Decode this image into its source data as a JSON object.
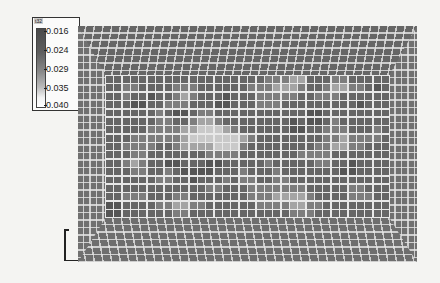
{
  "chart_data": {
    "type": "heatmap",
    "title": "",
    "legend": {
      "title": "t32",
      "ticks": [
        "0.016",
        "0.024",
        "0.029",
        "0.035",
        "0.040"
      ],
      "range": [
        0.016,
        0.04
      ],
      "colormap": "grayscale (dark = low, light = high)"
    },
    "grid": {
      "columns": 34,
      "rows": 17
    },
    "values_scale": "0=darkest (~0.016) ... 4=lightest (~0.040)",
    "values": [
      [
        1,
        1,
        1,
        1,
        1,
        1,
        1,
        1,
        1,
        1,
        1,
        1,
        1,
        1,
        1,
        1,
        1,
        1,
        1,
        2,
        2,
        2,
        3,
        3,
        1,
        1,
        1,
        2,
        2,
        1,
        1,
        1,
        1,
        1
      ],
      [
        1,
        1,
        2,
        2,
        1,
        1,
        1,
        1,
        2,
        2,
        2,
        1,
        1,
        1,
        1,
        1,
        1,
        2,
        2,
        2,
        3,
        3,
        3,
        2,
        1,
        1,
        2,
        3,
        3,
        2,
        2,
        1,
        0,
        1
      ],
      [
        1,
        1,
        2,
        1,
        1,
        0,
        1,
        1,
        2,
        3,
        2,
        1,
        1,
        1,
        0,
        1,
        1,
        1,
        2,
        2,
        2,
        2,
        2,
        1,
        1,
        2,
        2,
        2,
        1,
        1,
        1,
        1,
        1,
        1
      ],
      [
        1,
        1,
        1,
        0,
        0,
        1,
        1,
        2,
        2,
        2,
        1,
        1,
        1,
        0,
        0,
        1,
        1,
        1,
        2,
        2,
        2,
        1,
        1,
        1,
        1,
        1,
        1,
        1,
        1,
        1,
        0,
        1,
        1,
        1
      ],
      [
        1,
        1,
        1,
        1,
        1,
        1,
        2,
        1,
        0,
        0,
        1,
        2,
        2,
        1,
        1,
        1,
        1,
        1,
        1,
        1,
        1,
        1,
        1,
        1,
        0,
        0,
        1,
        1,
        1,
        1,
        1,
        1,
        1,
        1
      ],
      [
        1,
        1,
        1,
        1,
        1,
        1,
        2,
        2,
        1,
        1,
        2,
        3,
        3,
        2,
        1,
        1,
        1,
        1,
        1,
        1,
        1,
        1,
        0,
        1,
        0,
        0,
        1,
        2,
        1,
        1,
        1,
        1,
        1,
        1
      ],
      [
        1,
        1,
        1,
        1,
        1,
        2,
        2,
        2,
        2,
        3,
        3,
        4,
        4,
        4,
        3,
        2,
        1,
        1,
        1,
        1,
        1,
        1,
        0,
        0,
        1,
        1,
        2,
        2,
        2,
        1,
        1,
        1,
        2,
        1
      ],
      [
        1,
        1,
        1,
        2,
        2,
        2,
        2,
        2,
        2,
        3,
        4,
        4,
        4,
        4,
        4,
        4,
        3,
        2,
        1,
        1,
        1,
        1,
        1,
        1,
        1,
        1,
        2,
        2,
        3,
        2,
        2,
        2,
        2,
        1
      ],
      [
        1,
        1,
        2,
        2,
        2,
        2,
        1,
        1,
        2,
        3,
        3,
        3,
        3,
        4,
        4,
        4,
        2,
        1,
        1,
        1,
        1,
        1,
        1,
        1,
        1,
        2,
        2,
        3,
        3,
        2,
        2,
        1,
        1,
        1
      ],
      [
        1,
        1,
        1,
        2,
        2,
        1,
        1,
        1,
        1,
        1,
        1,
        1,
        2,
        2,
        2,
        2,
        1,
        1,
        1,
        1,
        1,
        1,
        1,
        2,
        2,
        2,
        2,
        1,
        1,
        1,
        1,
        1,
        1,
        1
      ],
      [
        1,
        1,
        2,
        3,
        2,
        1,
        1,
        0,
        0,
        1,
        1,
        1,
        0,
        0,
        1,
        1,
        1,
        1,
        1,
        2,
        1,
        1,
        1,
        1,
        1,
        2,
        2,
        1,
        1,
        0,
        1,
        1,
        1,
        1
      ],
      [
        1,
        1,
        1,
        2,
        2,
        1,
        1,
        2,
        1,
        0,
        0,
        0,
        0,
        1,
        1,
        1,
        2,
        1,
        1,
        1,
        2,
        1,
        1,
        1,
        1,
        1,
        1,
        1,
        0,
        0,
        1,
        1,
        1,
        1
      ],
      [
        1,
        1,
        1,
        1,
        1,
        1,
        2,
        2,
        1,
        1,
        0,
        1,
        1,
        1,
        2,
        1,
        2,
        2,
        1,
        1,
        2,
        2,
        1,
        1,
        1,
        1,
        1,
        1,
        1,
        1,
        1,
        1,
        1,
        1
      ],
      [
        1,
        1,
        1,
        1,
        1,
        1,
        1,
        1,
        1,
        1,
        1,
        1,
        2,
        2,
        1,
        1,
        1,
        2,
        2,
        2,
        2,
        2,
        2,
        2,
        1,
        1,
        1,
        1,
        1,
        2,
        2,
        1,
        1,
        1
      ],
      [
        1,
        1,
        2,
        2,
        2,
        1,
        1,
        1,
        2,
        2,
        1,
        1,
        1,
        1,
        1,
        1,
        1,
        2,
        2,
        2,
        3,
        3,
        3,
        3,
        2,
        1,
        1,
        1,
        1,
        2,
        2,
        2,
        1,
        1
      ],
      [
        0,
        0,
        1,
        1,
        1,
        1,
        2,
        2,
        3,
        3,
        2,
        2,
        1,
        1,
        1,
        1,
        1,
        1,
        2,
        2,
        2,
        2,
        3,
        3,
        2,
        2,
        1,
        1,
        1,
        1,
        1,
        1,
        1,
        1
      ],
      [
        0,
        0,
        1,
        1,
        1,
        1,
        1,
        1,
        2,
        2,
        1,
        1,
        1,
        1,
        1,
        1,
        1,
        1,
        1,
        1,
        1,
        1,
        2,
        2,
        2,
        1,
        1,
        1,
        1,
        1,
        1,
        1,
        1,
        1
      ]
    ]
  }
}
